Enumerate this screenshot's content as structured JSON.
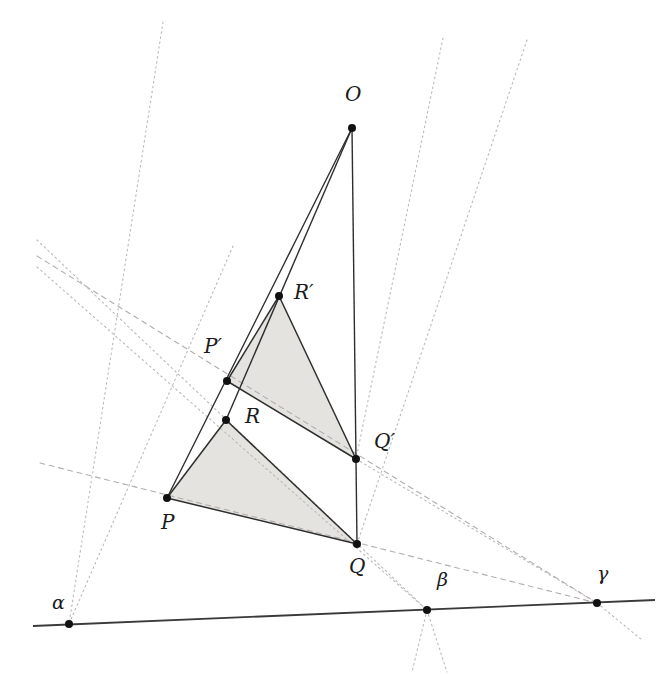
{
  "figure": {
    "width": 663,
    "height": 674,
    "background_color": "#ffffff",
    "solid_line_color": "#2b2b2b",
    "dotted_line_color": "#b9b4b4",
    "dashed_line_color": "#b0aaaa",
    "fill_color": "#e3e2de",
    "point_color": "#111111"
  },
  "labels": {
    "O": "O",
    "P": "P",
    "Q": "Q",
    "R": "R",
    "Pprime": "P′",
    "Qprime": "Q′",
    "Rprime": "R′",
    "alpha": "α",
    "beta": "β",
    "gamma": "γ"
  },
  "chart_data": {
    "type": "diagram",
    "points": [
      {
        "name": "O",
        "label": "O",
        "x": 352,
        "y": 128,
        "label_x": 345,
        "label_y": 84
      },
      {
        "name": "P",
        "label": "P",
        "x": 167,
        "y": 498,
        "label_x": 161,
        "label_y": 512
      },
      {
        "name": "Q",
        "label": "Q",
        "x": 357,
        "y": 544,
        "label_x": 349,
        "label_y": 556
      },
      {
        "name": "R",
        "label": "R",
        "x": 226,
        "y": 420,
        "label_x": 245,
        "label_y": 406
      },
      {
        "name": "P'",
        "label": "P′",
        "x": 227,
        "y": 381,
        "label_x": 204,
        "label_y": 336
      },
      {
        "name": "Q'",
        "label": "Q′",
        "x": 356,
        "y": 459,
        "label_x": 374,
        "label_y": 431
      },
      {
        "name": "R'",
        "label": "R′",
        "x": 279,
        "y": 296,
        "label_x": 294,
        "label_y": 282
      },
      {
        "name": "alpha",
        "label": "α",
        "x": 69,
        "y": 624,
        "label_x": 52,
        "label_y": 593
      },
      {
        "name": "beta",
        "label": "β",
        "x": 427,
        "y": 610,
        "label_x": 437,
        "label_y": 570
      },
      {
        "name": "gamma",
        "label": "γ",
        "x": 597,
        "y": 603,
        "label_x": 597,
        "label_y": 564
      }
    ],
    "triangles": [
      {
        "name": "PQR",
        "vertices": [
          "P",
          "Q",
          "R"
        ],
        "filled": true
      },
      {
        "name": "P'Q'R'",
        "vertices": [
          "P'",
          "Q'",
          "R'"
        ],
        "filled": true
      }
    ],
    "solid_segments": [
      {
        "from": "O",
        "to": "P"
      },
      {
        "from": "O",
        "to": "Q"
      },
      {
        "from": "O",
        "to": "R"
      },
      {
        "from": "P",
        "to": "Q"
      },
      {
        "from": "Q",
        "to": "R"
      },
      {
        "from": "R",
        "to": "P"
      },
      {
        "from": "P'",
        "to": "Q'"
      },
      {
        "from": "Q'",
        "to": "R'"
      },
      {
        "from": "R'",
        "to": "P'"
      }
    ],
    "axis_line": {
      "from": "alpha",
      "to": "gamma",
      "style": "solid",
      "name": "desargues-axis"
    },
    "perspective_rays": [
      {
        "name": "ray-O-P",
        "through": [
          "O",
          "P'",
          "P"
        ],
        "style": "solid"
      },
      {
        "name": "ray-O-Q",
        "through": [
          "O",
          "Q'",
          "Q"
        ],
        "style": "solid"
      },
      {
        "name": "ray-O-R",
        "through": [
          "O",
          "R'",
          "R"
        ],
        "style": "solid"
      }
    ],
    "extension_lines": [
      {
        "name": "line-PQ-to-gamma",
        "through": [
          "P",
          "Q"
        ],
        "meets": "gamma",
        "style": "dashed"
      },
      {
        "name": "line-P'Q'-to-gamma",
        "through": [
          "P'",
          "Q'"
        ],
        "meets": "gamma",
        "style": "dashed"
      },
      {
        "name": "line-QR-to-beta",
        "through": [
          "Q",
          "R"
        ],
        "meets": "beta",
        "style": "dotted"
      },
      {
        "name": "line-Q'R'-to-beta",
        "through": [
          "Q'",
          "R'"
        ],
        "meets": "beta",
        "style": "dotted"
      },
      {
        "name": "line-RP-to-alpha",
        "through": [
          "R",
          "P"
        ],
        "meets": "alpha",
        "style": "dotted"
      },
      {
        "name": "line-R'P'-to-alpha",
        "through": [
          "R'",
          "P'"
        ],
        "meets": "alpha",
        "style": "dotted"
      }
    ]
  }
}
